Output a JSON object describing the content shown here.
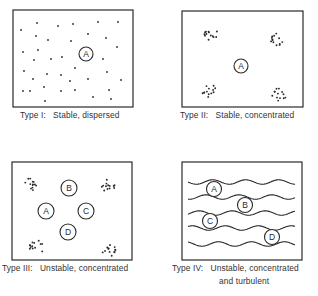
{
  "figure": {
    "panels": [
      {
        "id": "type-1",
        "box": [
          13,
          10,
          133,
          107
        ],
        "caption_lines": [
          "Type I:   Stable, dispersed"
        ],
        "caption_pos": [
          20,
          110
        ],
        "pattern": "dispersed",
        "dots": [
          [
            37,
            23
          ],
          [
            58,
            26
          ],
          [
            73,
            24
          ],
          [
            21,
            30
          ],
          [
            36,
            36
          ],
          [
            48,
            40
          ],
          [
            71,
            41
          ],
          [
            23,
            52
          ],
          [
            38,
            50
          ],
          [
            34,
            60
          ],
          [
            51,
            59
          ],
          [
            62,
            57
          ],
          [
            24,
            71
          ],
          [
            47,
            74
          ],
          [
            61,
            75
          ],
          [
            70,
            81
          ],
          [
            33,
            79
          ],
          [
            44,
            87
          ],
          [
            23,
            91
          ],
          [
            30,
            91
          ],
          [
            61,
            91
          ],
          [
            45,
            101
          ],
          [
            98,
            22
          ],
          [
            118,
            22
          ],
          [
            88,
            34
          ],
          [
            106,
            38
          ],
          [
            117,
            47
          ],
          [
            103,
            59
          ],
          [
            75,
            68
          ],
          [
            107,
            72
          ],
          [
            88,
            79
          ],
          [
            121,
            80
          ],
          [
            75,
            90
          ],
          [
            109,
            90
          ],
          [
            93,
            97
          ],
          [
            111,
            99
          ]
        ],
        "circles": [
          {
            "label": "A",
            "cx": 86,
            "cy": 54,
            "r": 7
          }
        ]
      },
      {
        "id": "type-2",
        "box": [
          182,
          11,
          303,
          107
        ],
        "caption_lines": [
          "Type II:   Stable, concentrated"
        ],
        "caption_pos": [
          180,
          110
        ],
        "pattern": "clusters",
        "clusters": [
          [
            210,
            34
          ],
          [
            276,
            39
          ],
          [
            209,
            91
          ],
          [
            279,
            94
          ]
        ],
        "circles": [
          {
            "label": "A",
            "cx": 241,
            "cy": 66,
            "r": 7
          }
        ]
      },
      {
        "id": "type-3",
        "box": [
          12,
          162,
          132,
          260
        ],
        "caption_lines": [
          "Type III:   Unstable, concentrated"
        ],
        "caption_pos": [
          2,
          263
        ],
        "pattern": "clusters",
        "clusters": [
          [
            32,
            184
          ],
          [
            108,
            185
          ],
          [
            37,
            247
          ],
          [
            110,
            251
          ]
        ],
        "circles": [
          {
            "label": "B",
            "cx": 69,
            "cy": 188,
            "r": 8
          },
          {
            "label": "A",
            "cx": 46,
            "cy": 211,
            "r": 8
          },
          {
            "label": "C",
            "cx": 86,
            "cy": 211,
            "r": 8
          },
          {
            "label": "D",
            "cx": 68,
            "cy": 232,
            "r": 8
          }
        ]
      },
      {
        "id": "type-4",
        "box": [
          182,
          162,
          302,
          260
        ],
        "caption_lines": [
          "Type IV:   Unstable, concentrated",
          "                and turbulent"
        ],
        "caption_pos": [
          172,
          263
        ],
        "pattern": "waves",
        "waves": [
          182,
          197,
          213,
          228,
          244
        ],
        "wave_x": [
          188,
          295
        ],
        "circles": [
          {
            "label": "A",
            "cx": 214,
            "cy": 189,
            "r": 7.5
          },
          {
            "label": "B",
            "cx": 245,
            "cy": 205,
            "r": 7.5
          },
          {
            "label": "C",
            "cx": 210,
            "cy": 221,
            "r": 7.5
          },
          {
            "label": "D",
            "cx": 272,
            "cy": 237,
            "r": 7.5
          }
        ]
      }
    ],
    "captions": {
      "type1": "Type I:   Stable, dispersed",
      "type2": "Type II:   Stable, concentrated",
      "type3": "Type III:   Unstable, concentrated",
      "type4_line1": "Type IV:   Unstable, concentrated",
      "type4_line2": "and turbulent"
    },
    "colors": {
      "ink": "#2a2a2a",
      "background": "#ffffff"
    }
  }
}
